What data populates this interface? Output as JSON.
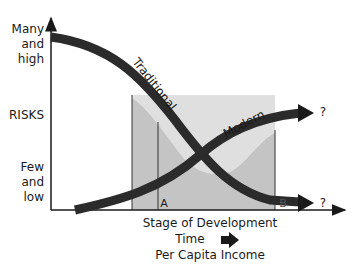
{
  "y_axis": {
    "top_label": [
      "Many",
      "and",
      "high"
    ],
    "middle_label": "RISKS",
    "bottom_label": [
      "Few",
      "and",
      "low"
    ]
  },
  "x_axis": {
    "line1": "Stage of Development",
    "line2": "Time",
    "line3": "Per Capita Income"
  },
  "curves": {
    "traditional": {
      "label": "Traditional",
      "end_label": "?"
    },
    "modern": {
      "label": "Modern",
      "end_label": "?"
    }
  },
  "markers": {
    "a": "A",
    "b": "B"
  },
  "colors": {
    "curve": "#2b2b2b",
    "shade": "#b8b8b8",
    "axis": "#1a1a1a"
  }
}
